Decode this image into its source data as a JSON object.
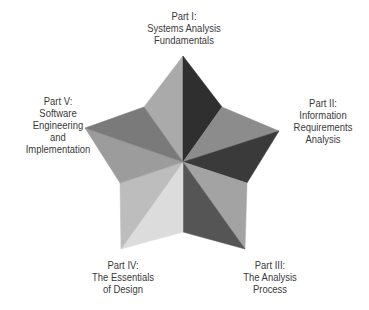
{
  "diagram": {
    "type": "five-point star of book parts",
    "center": [
      183,
      162
    ],
    "outer_points": {
      "top": [
        183,
        56
      ],
      "right": [
        279,
        131
      ],
      "bottom_right": [
        245,
        249
      ],
      "bottom_left": [
        121,
        249
      ],
      "left": [
        85,
        128
      ]
    },
    "inner_points": {
      "upper_right": [
        222,
        107
      ],
      "lower_right": [
        247,
        183
      ],
      "bottom": [
        183,
        232
      ],
      "lower_left": [
        120,
        183
      ],
      "upper_left": [
        144,
        107
      ]
    },
    "facet_colors": {
      "top_left": "#aaaaaa",
      "top_right": "#2f2f2f",
      "right_upper": "#8c8c8c",
      "right_lower": "#3a3a3a",
      "bottom_right_right": "#a3a3a3",
      "bottom_right_left": "#555555",
      "bottom_left_right": "#dcdcdc",
      "bottom_left_left": "#bdbdbd",
      "left_lower": "#9c9c9c",
      "left_upper": "#7a7a7a"
    },
    "parts": [
      {
        "id": "part-1",
        "lines": [
          "Part I:",
          "Systems Analysis",
          "Fundamentals"
        ]
      },
      {
        "id": "part-2",
        "lines": [
          "Part II:",
          "Information",
          "Requirements",
          "Analysis"
        ]
      },
      {
        "id": "part-3",
        "lines": [
          "Part III:",
          "The Analysis",
          "Process"
        ]
      },
      {
        "id": "part-4",
        "lines": [
          "Part IV:",
          "The Essentials",
          "of Design"
        ]
      },
      {
        "id": "part-5",
        "lines": [
          "Part V:",
          "Software",
          "Engineering",
          "and",
          "Implementation"
        ]
      }
    ]
  }
}
